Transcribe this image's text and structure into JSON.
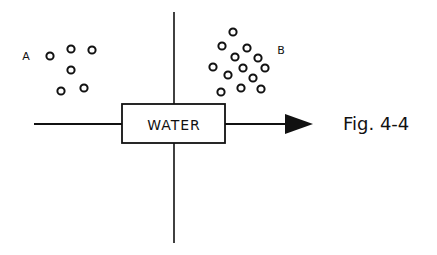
{
  "figure": {
    "caption": "Fig. 4-4",
    "box_label": "WATER",
    "group_a": {
      "label": "A",
      "label_pos": [
        26,
        56
      ],
      "circles": [
        [
          50,
          56
        ],
        [
          71,
          49
        ],
        [
          92,
          50
        ],
        [
          71,
          70
        ],
        [
          61,
          91
        ],
        [
          84,
          88
        ]
      ]
    },
    "group_b": {
      "label": "B",
      "label_pos": [
        281,
        50
      ],
      "circles": [
        [
          233,
          32
        ],
        [
          222,
          46
        ],
        [
          247,
          48
        ],
        [
          235,
          57
        ],
        [
          258,
          58
        ],
        [
          213,
          67
        ],
        [
          243,
          68
        ],
        [
          265,
          68
        ],
        [
          228,
          75
        ],
        [
          253,
          78
        ],
        [
          221,
          92
        ],
        [
          241,
          88
        ],
        [
          261,
          89
        ]
      ]
    },
    "colors": {
      "ink": "#111111",
      "background": "#ffffff"
    }
  }
}
